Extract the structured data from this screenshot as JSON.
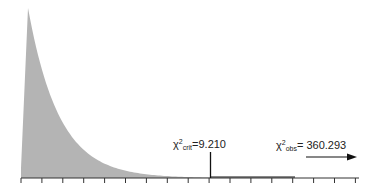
{
  "chart_data": {
    "type": "area",
    "title": "",
    "xlabel": "",
    "ylabel": "",
    "x_ticks_count": 17,
    "tick_labels": [],
    "grid": false,
    "curve": {
      "df": 2,
      "fill_color": "#b4b4b4",
      "x": [
        0,
        1,
        2,
        3,
        4,
        5,
        6,
        7,
        8,
        9,
        10
      ],
      "density": [
        0.5,
        0.303,
        0.184,
        0.112,
        0.068,
        0.041,
        0.025,
        0.015,
        0.009,
        0.006,
        0.003
      ]
    },
    "annotations": [
      {
        "id": "critical",
        "symbol": "χ",
        "superscript": "2",
        "subscript": "crit",
        "text": "=9.210",
        "value": 9.21,
        "marker": "vertical-line"
      },
      {
        "id": "observed",
        "symbol": "χ",
        "superscript": "2",
        "subscript": "obs",
        "text": "= 360.293",
        "value": 360.293,
        "marker": "right-arrow"
      }
    ]
  },
  "labels": {
    "crit_symbol": "χ",
    "crit_sup": "2",
    "crit_sub": "crit",
    "crit_value": "=9.210",
    "obs_symbol": "χ",
    "obs_sup": "2",
    "obs_sub": "obs",
    "obs_value": "= 360.293"
  }
}
